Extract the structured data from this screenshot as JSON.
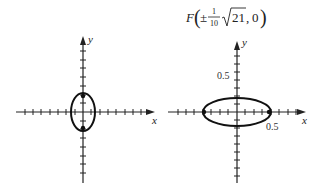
{
  "title": {
    "letter": "F",
    "pm": "±",
    "frac_num": "1",
    "frac_den": "10",
    "radicand": "21",
    "y": "0"
  },
  "left_graph": {
    "x_label": "x",
    "y_label": "y",
    "ellipse": {
      "orientation": "vertical"
    },
    "foci": "on y-axis"
  },
  "right_graph": {
    "x_label": "x",
    "y_label": "y",
    "x_tick_label": "0.5",
    "y_tick_label": "0.5",
    "ellipse": {
      "orientation": "horizontal"
    },
    "foci": "on x-axis"
  },
  "colors": {
    "ink": "#222222",
    "background": "#ffffff"
  }
}
